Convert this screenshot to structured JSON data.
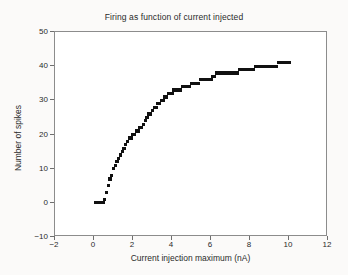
{
  "chart_data": {
    "type": "scatter",
    "title": "Firing as function of current injected",
    "xlabel": "Current injection maximum (nA)",
    "ylabel": "Number of spikes",
    "xlim": [
      -2,
      12
    ],
    "ylim": [
      -10,
      50
    ],
    "xticks": [
      -2,
      0,
      2,
      4,
      6,
      8,
      10,
      12
    ],
    "yticks": [
      -10,
      0,
      10,
      20,
      30,
      40,
      50
    ],
    "xtick_labels": [
      "−2",
      "0",
      "2",
      "4",
      "6",
      "8",
      "10",
      "12"
    ],
    "ytick_labels": [
      "−10",
      "0",
      "10",
      "20",
      "30",
      "40",
      "50"
    ],
    "grid": false,
    "legend": null,
    "marker": "square",
    "marker_color": "#111111",
    "series": [
      {
        "name": "spike count",
        "x": [
          0.1,
          0.19,
          0.28,
          0.37,
          0.46,
          0.55,
          0.64,
          0.73,
          0.82,
          0.91,
          1.0,
          1.09,
          1.18,
          1.27,
          1.36,
          1.45,
          1.54,
          1.63,
          1.72,
          1.81,
          1.9,
          2.0,
          2.09,
          2.18,
          2.27,
          2.36,
          2.45,
          2.54,
          2.63,
          2.72,
          2.81,
          2.9,
          3.0,
          3.09,
          3.18,
          3.27,
          3.36,
          3.45,
          3.54,
          3.63,
          3.72,
          3.81,
          3.9,
          4.0,
          4.09,
          4.18,
          4.27,
          4.36,
          4.45,
          4.54,
          4.63,
          4.72,
          4.81,
          4.9,
          5.0,
          5.09,
          5.18,
          5.27,
          5.36,
          5.45,
          5.54,
          5.63,
          5.72,
          5.81,
          5.9,
          6.0,
          6.09,
          6.18,
          6.27,
          6.36,
          6.45,
          6.54,
          6.63,
          6.72,
          6.81,
          6.9,
          7.0,
          7.09,
          7.18,
          7.27,
          7.36,
          7.45,
          7.54,
          7.63,
          7.72,
          7.81,
          7.9,
          8.0,
          8.09,
          8.18,
          8.27,
          8.36,
          8.45,
          8.54,
          8.63,
          8.72,
          8.81,
          8.9,
          9.0,
          9.09,
          9.18,
          9.27,
          9.36,
          9.45,
          9.54,
          9.63,
          9.72,
          9.81,
          9.9,
          10.0
        ],
        "y": [
          0,
          0,
          0,
          0,
          0,
          1,
          3,
          5,
          7,
          8,
          10,
          11,
          12,
          13,
          14,
          15,
          16,
          17,
          18,
          19,
          19,
          20,
          20,
          21,
          21,
          22,
          22,
          23,
          24,
          25,
          26,
          26,
          27,
          28,
          28,
          29,
          29,
          30,
          30,
          31,
          31,
          32,
          32,
          32,
          33,
          33,
          33,
          33,
          33,
          34,
          34,
          34,
          34,
          34,
          35,
          35,
          35,
          35,
          35,
          36,
          36,
          36,
          36,
          36,
          36,
          36,
          37,
          37,
          38,
          38,
          38,
          38,
          38,
          38,
          38,
          38,
          38,
          38,
          38,
          38,
          38,
          39,
          39,
          39,
          39,
          39,
          39,
          39,
          39,
          39,
          40,
          40,
          40,
          40,
          40,
          40,
          40,
          40,
          40,
          40,
          40,
          40,
          40,
          41,
          41,
          41,
          41,
          41,
          41,
          41
        ]
      }
    ]
  }
}
